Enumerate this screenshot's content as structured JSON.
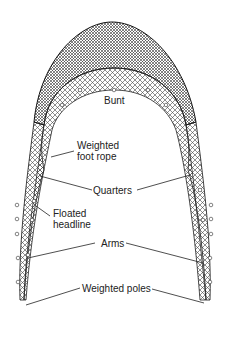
{
  "diagram": {
    "labels": {
      "bunt": "Bunt",
      "weighted_foot_rope_1": "Weighted",
      "weighted_foot_rope_2": "foot rope",
      "quarters": "Quarters",
      "floated_headline_1": "Floated",
      "floated_headline_2": "headline",
      "arms": "Arms",
      "weighted_poles": "Weighted poles"
    }
  }
}
